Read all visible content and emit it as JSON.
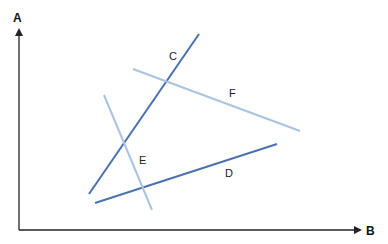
{
  "diagram": {
    "axes": {
      "y": {
        "label": "A",
        "x1": 19,
        "y1": 230,
        "x2": 19,
        "y2": 30
      },
      "x": {
        "label": "B",
        "x1": 19,
        "y1": 230,
        "x2": 360,
        "y2": 230
      },
      "color": "#222222"
    },
    "lines": [
      {
        "name": "C",
        "x1": 89,
        "y1": 194,
        "x2": 199,
        "y2": 34,
        "color": "#4a72b0",
        "label_x": 169,
        "label_y": 60
      },
      {
        "name": "D",
        "x1": 95,
        "y1": 203,
        "x2": 277,
        "y2": 144,
        "color": "#4a72b0",
        "label_x": 225,
        "label_y": 177
      },
      {
        "name": "E",
        "x1": 104,
        "y1": 95,
        "x2": 152,
        "y2": 210,
        "color": "#a9c3e2",
        "label_x": 139,
        "label_y": 164
      },
      {
        "name": "F",
        "x1": 133,
        "y1": 69,
        "x2": 300,
        "y2": 131,
        "color": "#a9c3e2",
        "label_x": 229,
        "label_y": 97
      }
    ]
  }
}
